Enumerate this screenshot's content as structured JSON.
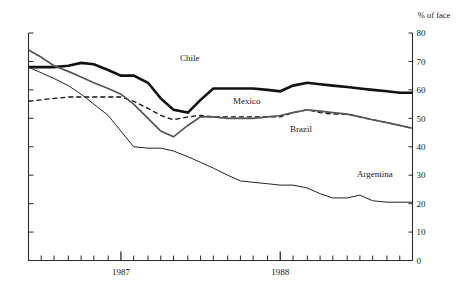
{
  "chart_data": {
    "type": "line",
    "title": "",
    "subtitle": "",
    "xlabel": "",
    "ylabel": "% of face value",
    "ylabel_visible_text": "% of face",
    "ylim": [
      0,
      80
    ],
    "y_ticks": [
      0,
      10,
      20,
      30,
      40,
      50,
      60,
      70,
      80
    ],
    "y_tick_labels": [
      "0",
      "10",
      "20",
      "30",
      "40",
      "50",
      "60",
      "70",
      "80"
    ],
    "y_axis_position": "right",
    "grid": false,
    "legend": "inline-annotations",
    "x_major_ticks": [
      1987,
      1988
    ],
    "x_major_tick_labels": [
      "1987",
      "1988"
    ],
    "x_minor_tick_count": 29,
    "x_range": [
      "1986.42",
      "1988.83"
    ],
    "x": [
      1986.42,
      1986.5,
      1986.58,
      1986.67,
      1986.75,
      1986.83,
      1986.92,
      1987.0,
      1987.08,
      1987.17,
      1987.25,
      1987.33,
      1987.42,
      1987.5,
      1987.58,
      1987.67,
      1987.75,
      1987.83,
      1987.92,
      1988.0,
      1988.08,
      1988.17,
      1988.25,
      1988.33,
      1988.42,
      1988.5,
      1988.58,
      1988.67,
      1988.75,
      1988.83
    ],
    "series": [
      {
        "name": "Chile",
        "style": "thick-solid-black",
        "color": "#111111",
        "width": 2.6,
        "values": [
          68.0,
          68.0,
          68.0,
          68.5,
          69.5,
          69.0,
          67.0,
          65.0,
          65.0,
          62.5,
          57.0,
          53.0,
          52.0,
          56.5,
          60.5,
          60.5,
          60.5,
          60.5,
          60.0,
          59.5,
          61.5,
          62.5,
          62.0,
          61.5,
          61.0,
          60.5,
          60.0,
          59.5,
          59.0,
          59.0
        ]
      },
      {
        "name": "Mexico",
        "style": "dashed-black",
        "color": "#111111",
        "width": 1.3,
        "dash": "5,3",
        "values": [
          56.0,
          56.5,
          57.0,
          57.5,
          57.5,
          57.5,
          57.5,
          57.5,
          56.0,
          53.5,
          51.0,
          49.5,
          50.5,
          51.0,
          50.5,
          50.5,
          50.5,
          50.5,
          50.5,
          50.5,
          52.0,
          53.0,
          52.0,
          51.5,
          51.5,
          50.5,
          49.5,
          48.5,
          47.5,
          46.5
        ]
      },
      {
        "name": "Brazil",
        "style": "medium-solid-gray",
        "color": "#555555",
        "width": 1.7,
        "values": [
          74.0,
          71.5,
          68.5,
          66.5,
          64.5,
          62.5,
          60.5,
          58.5,
          55.0,
          50.0,
          45.5,
          43.5,
          47.5,
          50.5,
          50.5,
          50.0,
          50.0,
          50.0,
          50.5,
          51.0,
          52.0,
          53.0,
          52.5,
          52.0,
          51.5,
          50.5,
          49.5,
          48.5,
          47.5,
          46.5
        ]
      },
      {
        "name": "Argentina",
        "style": "thin-solid-black",
        "color": "#222222",
        "width": 1.0,
        "values": [
          68.0,
          66.0,
          64.0,
          61.5,
          58.5,
          55.0,
          51.0,
          45.5,
          40.0,
          39.5,
          39.5,
          38.5,
          36.5,
          34.5,
          32.5,
          30.0,
          28.0,
          27.5,
          27.0,
          26.5,
          26.5,
          25.5,
          23.5,
          22.0,
          22.0,
          23.0,
          21.0,
          20.5,
          20.5,
          20.5
        ]
      }
    ],
    "annotations": [
      {
        "text": "Chile",
        "x_px": 180,
        "y_px": 61
      },
      {
        "text": "Mexico",
        "x_px": 233,
        "y_px": 104
      },
      {
        "text": "Brazil",
        "x_px": 290,
        "y_px": 132
      },
      {
        "text": "Argentina",
        "x_px": 357,
        "y_px": 177
      }
    ]
  }
}
